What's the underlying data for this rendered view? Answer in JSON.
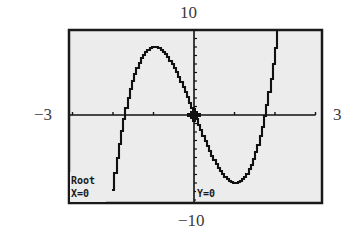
{
  "window": {
    "xmin_label": "−3",
    "xmax_label": "3",
    "ymin_label": "−10",
    "ymax_label": "10"
  },
  "screen": {
    "background": "#ececec",
    "frame_color": "#1a1a1a",
    "curve_color": "#111111",
    "status_line1": "Root",
    "status_x": "X=0",
    "status_y": "Y=0"
  },
  "chart_data": {
    "type": "line",
    "title": "",
    "xlabel": "",
    "ylabel": "",
    "xlim": [
      -3,
      3
    ],
    "ylim": [
      -10,
      10
    ],
    "x_tick_step": 1,
    "y_tick_step": 1,
    "grid": false,
    "function": "y = 4x^3 - 12x (approx.)",
    "series": [
      {
        "name": "f(x)",
        "x": [
          -2.1,
          -2.0,
          -1.9,
          -1.8,
          -1.732,
          -1.6,
          -1.4,
          -1.2,
          -1.0,
          -0.8,
          -0.6,
          -0.4,
          -0.2,
          0.0,
          0.2,
          0.4,
          0.6,
          0.8,
          1.0,
          1.2,
          1.4,
          1.6,
          1.732,
          1.8,
          1.9,
          2.0,
          2.02
        ],
        "values": [
          -11.8,
          -8.0,
          -4.6,
          -1.7,
          0.0,
          2.8,
          5.8,
          7.5,
          8.0,
          7.55,
          6.34,
          4.54,
          2.37,
          0.0,
          -2.37,
          -4.54,
          -6.34,
          -7.55,
          -8.0,
          -7.5,
          -5.8,
          -2.8,
          0.0,
          1.7,
          4.6,
          8.0,
          10.0
        ]
      }
    ],
    "annotations": [
      {
        "text": "Root",
        "position": "bottom-left"
      },
      {
        "text": "X=0",
        "position": "bottom-left"
      },
      {
        "text": "Y=0",
        "position": "bottom-center"
      }
    ],
    "cursor": {
      "x": 0,
      "y": 0
    }
  }
}
